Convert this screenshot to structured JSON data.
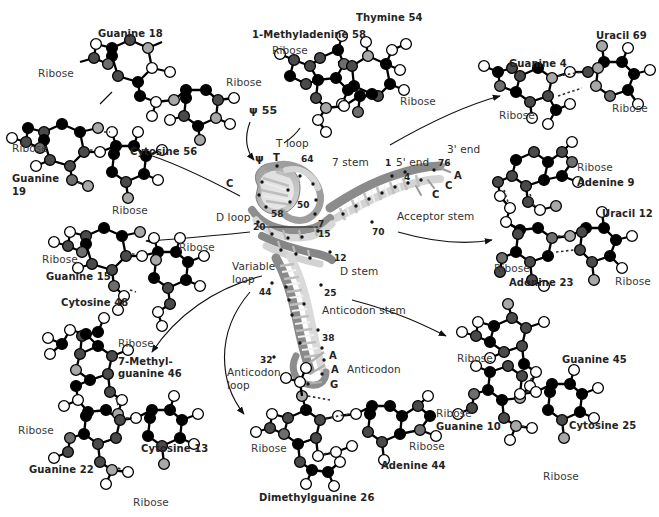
{
  "figure": {
    "type": "tRNA tertiary structure diagram",
    "background": "#ffffff",
    "ink": "#2b2b2b"
  },
  "molecules": [
    {
      "id": "guanine18-psi55",
      "labels": [
        {
          "text": "Guanine 18",
          "x": 98,
          "y": 28,
          "kind": "base"
        },
        {
          "text": "Ribose",
          "x": 38,
          "y": 68,
          "kind": "plain"
        },
        {
          "text": "Ribose",
          "x": 226,
          "y": 77,
          "kind": "plain"
        },
        {
          "text": "ψ 55",
          "x": 249,
          "y": 105,
          "kind": "greek"
        }
      ]
    },
    {
      "id": "methyladenine58-thymine54",
      "labels": [
        {
          "text": "1-Methyladenine 58",
          "x": 252,
          "y": 29,
          "kind": "base"
        },
        {
          "text": "Thymine 54",
          "x": 356,
          "y": 12,
          "kind": "base"
        },
        {
          "text": "Ribose",
          "x": 272,
          "y": 45,
          "kind": "plain"
        },
        {
          "text": "Ribose",
          "x": 400,
          "y": 96,
          "kind": "plain"
        }
      ]
    },
    {
      "id": "guanine4-uracil69",
      "labels": [
        {
          "text": "Uracil 69",
          "x": 596,
          "y": 30,
          "kind": "base"
        },
        {
          "text": "Guanine 4",
          "x": 509,
          "y": 58,
          "kind": "base"
        },
        {
          "text": "Ribose",
          "x": 499,
          "y": 110,
          "kind": "plain"
        },
        {
          "text": "Ribose",
          "x": 612,
          "y": 103,
          "kind": "plain"
        }
      ]
    },
    {
      "id": "adenine9-uracil12-adenine23",
      "labels": [
        {
          "text": "Ribose",
          "x": 577,
          "y": 162,
          "kind": "plain"
        },
        {
          "text": "Adenine 9",
          "x": 577,
          "y": 177,
          "kind": "base"
        },
        {
          "text": "Uracil 12",
          "x": 602,
          "y": 208,
          "kind": "base"
        },
        {
          "text": "Ribose",
          "x": 494,
          "y": 263,
          "kind": "plain"
        },
        {
          "text": "Adenine 23",
          "x": 509,
          "y": 277,
          "kind": "base"
        },
        {
          "text": "Ribose",
          "x": 615,
          "y": 276,
          "kind": "plain"
        }
      ]
    },
    {
      "id": "guanine19-cytosine56",
      "labels": [
        {
          "text": "Ribose",
          "x": 12,
          "y": 143,
          "kind": "plain"
        },
        {
          "text": "Cytosine 56",
          "x": 130,
          "y": 146,
          "kind": "base"
        },
        {
          "text": "Guanine",
          "x": 12,
          "y": 173,
          "kind": "base"
        },
        {
          "text": "19",
          "x": 12,
          "y": 186,
          "kind": "base"
        },
        {
          "text": "Ribose",
          "x": 112,
          "y": 205,
          "kind": "plain"
        }
      ]
    },
    {
      "id": "guanine15-cytosine48",
      "labels": [
        {
          "text": "Ribose",
          "x": 42,
          "y": 254,
          "kind": "plain"
        },
        {
          "text": "Guanine 15",
          "x": 46,
          "y": 271,
          "kind": "base"
        },
        {
          "text": "Ribose",
          "x": 179,
          "y": 242,
          "kind": "plain"
        },
        {
          "text": "Cytosine 48",
          "x": 61,
          "y": 297,
          "kind": "base"
        }
      ]
    },
    {
      "id": "methylguanine46-cytosine13-guanine22",
      "labels": [
        {
          "text": "Ribose",
          "x": 118,
          "y": 338,
          "kind": "plain"
        },
        {
          "text": "7-Methyl-",
          "x": 118,
          "y": 356,
          "kind": "base"
        },
        {
          "text": "guanine 46",
          "x": 118,
          "y": 368,
          "kind": "base"
        },
        {
          "text": "Ribose",
          "x": 18,
          "y": 425,
          "kind": "plain"
        },
        {
          "text": "Cytosine 13",
          "x": 141,
          "y": 443,
          "kind": "base"
        },
        {
          "text": "Guanine 22",
          "x": 29,
          "y": 464,
          "kind": "base"
        },
        {
          "text": "Ribose",
          "x": 133,
          "y": 497,
          "kind": "plain"
        }
      ]
    },
    {
      "id": "adenine44-dimethylguanine26",
      "labels": [
        {
          "text": "Ribose",
          "x": 251,
          "y": 443,
          "kind": "plain"
        },
        {
          "text": "Ribose",
          "x": 409,
          "y": 441,
          "kind": "plain"
        },
        {
          "text": "Adenine 44",
          "x": 381,
          "y": 460,
          "kind": "base"
        },
        {
          "text": "Dimethylguanine 26",
          "x": 259,
          "y": 492,
          "kind": "base"
        }
      ]
    },
    {
      "id": "guanine45-guanine10-cytosine25",
      "labels": [
        {
          "text": "Ribose",
          "x": 457,
          "y": 353,
          "kind": "plain"
        },
        {
          "text": "Guanine 45",
          "x": 562,
          "y": 354,
          "kind": "base"
        },
        {
          "text": "Ribose",
          "x": 436,
          "y": 408,
          "kind": "plain"
        },
        {
          "text": "Guanine 10",
          "x": 436,
          "y": 421,
          "kind": "base"
        },
        {
          "text": "Cytosine 25",
          "x": 569,
          "y": 420,
          "kind": "base"
        },
        {
          "text": "Ribose",
          "x": 543,
          "y": 471,
          "kind": "plain"
        }
      ]
    }
  ],
  "structure_labels": [
    {
      "text": "T loop",
      "x": 276,
      "y": 138,
      "kind": "struct"
    },
    {
      "text": "ψ",
      "x": 255,
      "y": 153,
      "kind": "greek"
    },
    {
      "text": "T",
      "x": 273,
      "y": 152,
      "kind": "base"
    },
    {
      "text": "64",
      "x": 301,
      "y": 154,
      "kind": "num"
    },
    {
      "text": "7 stem",
      "x": 332,
      "y": 157,
      "kind": "struct"
    },
    {
      "text": "1",
      "x": 385,
      "y": 158,
      "kind": "num"
    },
    {
      "text": "5' end",
      "x": 396,
      "y": 157,
      "kind": "struct"
    },
    {
      "text": "3' end",
      "x": 447,
      "y": 144,
      "kind": "struct"
    },
    {
      "text": "76",
      "x": 438,
      "y": 158,
      "kind": "num"
    },
    {
      "text": "A",
      "x": 454,
      "y": 170,
      "kind": "base"
    },
    {
      "text": "C",
      "x": 445,
      "y": 180,
      "kind": "base"
    },
    {
      "text": "C",
      "x": 432,
      "y": 189,
      "kind": "base"
    },
    {
      "text": "C",
      "x": 226,
      "y": 178,
      "kind": "base"
    },
    {
      "text": "4",
      "x": 404,
      "y": 172,
      "kind": "num"
    },
    {
      "text": "50",
      "x": 297,
      "y": 200,
      "kind": "num"
    },
    {
      "text": "58",
      "x": 271,
      "y": 209,
      "kind": "num"
    },
    {
      "text": "D loop",
      "x": 216,
      "y": 212,
      "kind": "struct"
    },
    {
      "text": "20",
      "x": 253,
      "y": 222,
      "kind": "num"
    },
    {
      "text": "7",
      "x": 318,
      "y": 219,
      "kind": "num"
    },
    {
      "text": "15",
      "x": 318,
      "y": 229,
      "kind": "num"
    },
    {
      "text": "70",
      "x": 372,
      "y": 227,
      "kind": "num"
    },
    {
      "text": "Acceptor stem",
      "x": 397,
      "y": 211,
      "kind": "struct"
    },
    {
      "text": "12",
      "x": 334,
      "y": 253,
      "kind": "num"
    },
    {
      "text": "Variable",
      "x": 232,
      "y": 261,
      "kind": "struct"
    },
    {
      "text": "loop",
      "x": 232,
      "y": 274,
      "kind": "struct"
    },
    {
      "text": "D stem",
      "x": 340,
      "y": 266,
      "kind": "struct"
    },
    {
      "text": "44",
      "x": 259,
      "y": 287,
      "kind": "num"
    },
    {
      "text": "25",
      "x": 324,
      "y": 288,
      "kind": "num"
    },
    {
      "text": "Anticodon stem",
      "x": 322,
      "y": 305,
      "kind": "struct"
    },
    {
      "text": "38",
      "x": 322,
      "y": 333,
      "kind": "num"
    },
    {
      "text": "32",
      "x": 260,
      "y": 355,
      "kind": "num"
    },
    {
      "text": "A",
      "x": 329,
      "y": 350,
      "kind": "base"
    },
    {
      "text": "A",
      "x": 331,
      "y": 364,
      "kind": "base"
    },
    {
      "text": "Anticodon",
      "x": 347,
      "y": 364,
      "kind": "struct"
    },
    {
      "text": "Anticodon",
      "x": 227,
      "y": 367,
      "kind": "struct"
    },
    {
      "text": "loop",
      "x": 227,
      "y": 380,
      "kind": "struct"
    },
    {
      "text": "G",
      "x": 330,
      "y": 379,
      "kind": "base"
    }
  ],
  "atom_colors": {
    "carbon": "#000000",
    "nitrogen": "#4a4a4a",
    "oxygen": "#ffffff",
    "oxygen_stroke": "#000000",
    "highlight": "#a8a8a8",
    "mid_gray": "#6e6e6e"
  },
  "ribbon_colors": {
    "dark": "#8a8a8a",
    "mid": "#b4b4b4",
    "light": "#dcdcdc",
    "pale": "#ededed"
  }
}
